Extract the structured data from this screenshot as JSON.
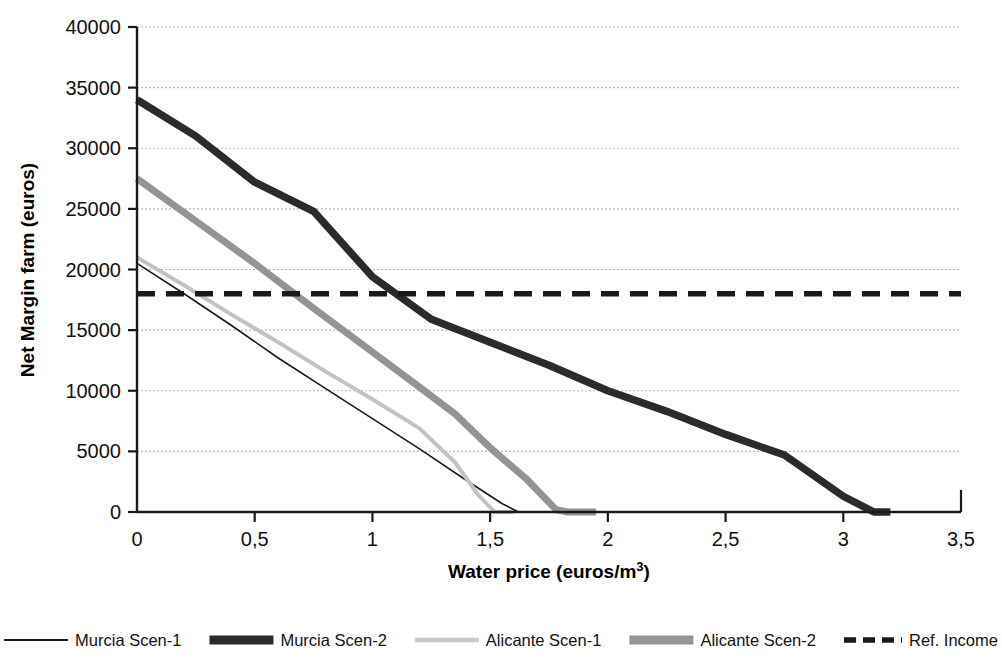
{
  "chart_data": {
    "type": "line",
    "title": "",
    "xlabel": "Water price (euros/m³)",
    "ylabel": "Net Margin farm (euros)",
    "xlim": [
      0,
      3.5
    ],
    "ylim": [
      0,
      40000
    ],
    "xticks": [
      0,
      0.5,
      1,
      1.5,
      2,
      2.5,
      3,
      3.5
    ],
    "xtick_labels": [
      "0",
      "0,5",
      "1",
      "1,5",
      "2",
      "2,5",
      "3",
      "3,5"
    ],
    "yticks": [
      0,
      5000,
      10000,
      15000,
      20000,
      25000,
      30000,
      35000,
      40000
    ],
    "ytick_labels": [
      "0",
      "5000",
      "10000",
      "15000",
      "20000",
      "25000",
      "30000",
      "35000",
      "40000"
    ],
    "grid": "horizontal-dotted",
    "legend_position": "bottom",
    "decimal_separator": ",",
    "series": [
      {
        "name": "Murcia Scen-1",
        "color": "#1a1a1a",
        "width": 1.6,
        "dash": "none",
        "points": [
          [
            0.0,
            20500
          ],
          [
            0.2,
            18000
          ],
          [
            0.4,
            15400
          ],
          [
            0.6,
            12700
          ],
          [
            0.8,
            10200
          ],
          [
            1.0,
            7700
          ],
          [
            1.2,
            5200
          ],
          [
            1.4,
            2600
          ],
          [
            1.55,
            700
          ],
          [
            1.62,
            0
          ],
          [
            1.7,
            0
          ]
        ]
      },
      {
        "name": "Murcia Scen-2",
        "color": "#2b2b2b",
        "width": 7.5,
        "dash": "none",
        "points": [
          [
            0.0,
            34000
          ],
          [
            0.25,
            31000
          ],
          [
            0.5,
            27200
          ],
          [
            0.75,
            24800
          ],
          [
            1.0,
            19400
          ],
          [
            1.25,
            15900
          ],
          [
            1.5,
            14000
          ],
          [
            1.75,
            12100
          ],
          [
            2.0,
            10000
          ],
          [
            2.25,
            8300
          ],
          [
            2.5,
            6400
          ],
          [
            2.75,
            4700
          ],
          [
            3.0,
            1300
          ],
          [
            3.13,
            0
          ],
          [
            3.2,
            0
          ]
        ]
      },
      {
        "name": "Alicante Scen-1",
        "color": "#c2c2c2",
        "width": 4.0,
        "dash": "none",
        "points": [
          [
            0.0,
            21000
          ],
          [
            0.2,
            18700
          ],
          [
            0.4,
            16300
          ],
          [
            0.6,
            14000
          ],
          [
            0.8,
            11600
          ],
          [
            1.0,
            9300
          ],
          [
            1.2,
            6900
          ],
          [
            1.35,
            4100
          ],
          [
            1.45,
            1400
          ],
          [
            1.52,
            0
          ],
          [
            1.6,
            0
          ]
        ]
      },
      {
        "name": "Alicante Scen-2",
        "color": "#949494",
        "width": 7.0,
        "dash": "none",
        "points": [
          [
            0.0,
            27500
          ],
          [
            0.25,
            24000
          ],
          [
            0.5,
            20500
          ],
          [
            0.75,
            16800
          ],
          [
            1.0,
            13200
          ],
          [
            1.2,
            10300
          ],
          [
            1.35,
            8100
          ],
          [
            1.5,
            5300
          ],
          [
            1.65,
            2800
          ],
          [
            1.78,
            200
          ],
          [
            1.83,
            0
          ],
          [
            1.95,
            0
          ]
        ]
      }
    ],
    "reference_line": {
      "name": "Ref. Income",
      "value": 18000,
      "color": "#1a1a1a",
      "width": 5.5,
      "dash": "18,11"
    }
  },
  "legend": {
    "items": [
      {
        "label": "Murcia Scen-1",
        "color": "#1a1a1a",
        "width": 1.8,
        "dash": "none",
        "swatch_len": 64
      },
      {
        "label": "Murcia Scen-2",
        "color": "#2b2b2b",
        "width": 9,
        "dash": "none",
        "swatch_len": 64
      },
      {
        "label": "Alicante Scen-1",
        "color": "#c9c9c9",
        "width": 4.5,
        "dash": "none",
        "swatch_len": 64
      },
      {
        "label": "Alicante Scen-2",
        "color": "#949494",
        "width": 9,
        "dash": "none",
        "swatch_len": 64
      },
      {
        "label": "Ref. Income",
        "color": "#1a1a1a",
        "width": 5.5,
        "dash": "12,7",
        "swatch_len": 58
      }
    ]
  },
  "axes": {
    "x_title_main": "Water price (euros/m",
    "x_title_sup": "3",
    "x_title_tail": ")",
    "y_title": "Net Margin farm (euros)"
  },
  "colors": {
    "background": "#ffffff",
    "axis": "#1a1a1a",
    "gridline": "#b8b8b8",
    "text": "#111111"
  }
}
